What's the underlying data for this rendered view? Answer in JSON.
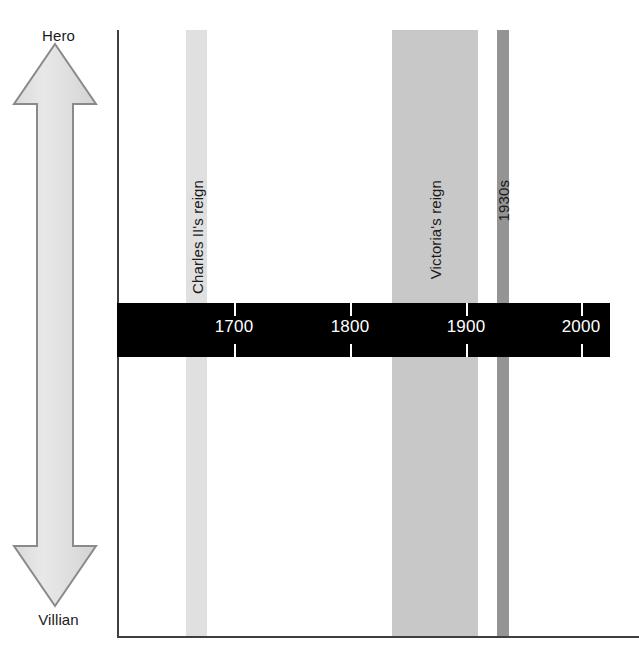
{
  "figure": {
    "background_color": "#ffffff",
    "frame_color": "#3f3f3f",
    "width": 639,
    "height": 667
  },
  "y_axis": {
    "top_label": "Hero",
    "bottom_label": "Villian",
    "arrow_fill": "#e3e3e3",
    "arrow_stroke": "#8a8a8a"
  },
  "timeline": {
    "bar_color": "#000000",
    "tick_color": "#ffffff",
    "ticks": [
      {
        "label": "1700",
        "x": 234
      },
      {
        "label": "1800",
        "x": 350
      },
      {
        "label": "1900",
        "x": 466
      },
      {
        "label": "2000",
        "x": 581
      }
    ]
  },
  "bands": [
    {
      "label": "Charles II's reign",
      "color": "#e0e0e0",
      "left": 186,
      "width": 21
    },
    {
      "label": "Victoria's reign",
      "color": "#c8c8c8",
      "left": 392,
      "width": 86
    },
    {
      "label": "1930s",
      "color": "#949494",
      "left": 497,
      "width": 12
    }
  ],
  "chart_data": {
    "type": "timeline",
    "title": "",
    "xlabel": "",
    "ylabel": "Hero – Villian",
    "x_tick_labels": [
      "1700",
      "1800",
      "1900",
      "2000"
    ],
    "x_tick_values": [
      1700,
      1800,
      1900,
      2000
    ],
    "xlim": [
      1650,
      2015
    ],
    "y_axis_poles": [
      "Hero",
      "Villian"
    ],
    "grid": false,
    "legend": "none",
    "annotations": [
      {
        "label": "Charles II's reign",
        "type": "vertical-band",
        "start_year": 1660,
        "end_year": 1685,
        "color": "#e0e0e0"
      },
      {
        "label": "Victoria's reign",
        "type": "vertical-band",
        "start_year": 1837,
        "end_year": 1901,
        "color": "#c8c8c8"
      },
      {
        "label": "1930s",
        "type": "vertical-band",
        "start_year": 1930,
        "end_year": 1939,
        "color": "#949494"
      }
    ]
  }
}
